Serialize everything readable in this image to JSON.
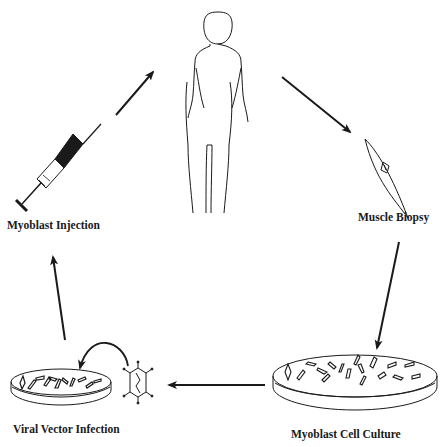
{
  "diagram": {
    "type": "cycle",
    "colors": {
      "ink": "#1a1a1a",
      "background": "#ffffff"
    },
    "nodes": [
      {
        "id": "patient",
        "icon": "human-figure-icon",
        "label": ""
      },
      {
        "id": "biopsy",
        "icon": "muscle-tissue-icon",
        "label": "Muscle Biopsy"
      },
      {
        "id": "culture",
        "icon": "petri-dish-icon",
        "label": "Myoblast Cell Culture"
      },
      {
        "id": "infection",
        "icon": "petri-dish-virus-icon",
        "label": "Viral Vector Infection"
      },
      {
        "id": "injection",
        "icon": "syringe-icon",
        "label": "Myoblast Injection"
      }
    ],
    "edges": [
      {
        "from": "patient",
        "to": "biopsy"
      },
      {
        "from": "biopsy",
        "to": "culture"
      },
      {
        "from": "culture",
        "to": "infection"
      },
      {
        "from": "virus",
        "to": "infection",
        "style": "curved"
      },
      {
        "from": "infection",
        "to": "injection"
      },
      {
        "from": "injection",
        "to": "patient"
      }
    ]
  }
}
